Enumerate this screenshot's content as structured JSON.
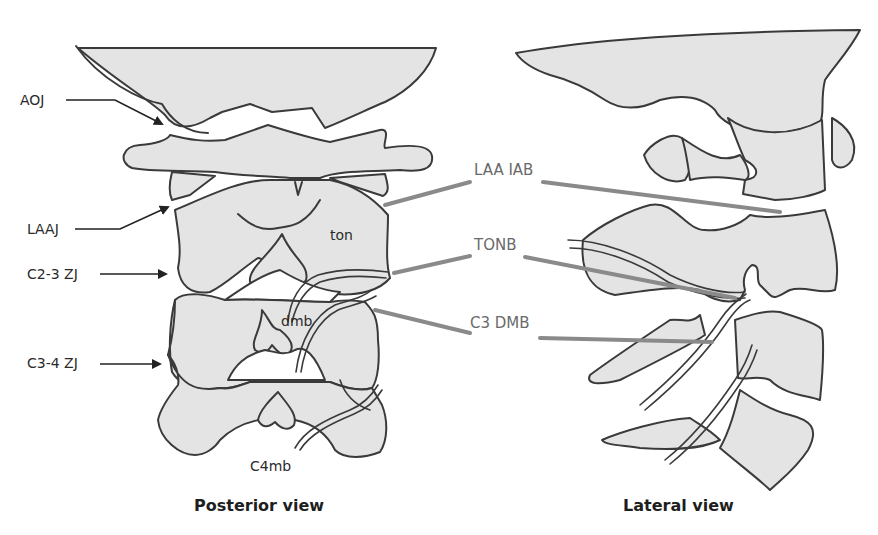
{
  "figure": {
    "type": "anatomical-diagram",
    "colors": {
      "bone_fill": "#e4e4e4",
      "outline": "#3a3a3a",
      "needle": "#8a8a8a",
      "background": "#ffffff"
    }
  },
  "posterior_view": {
    "caption": "Posterior view",
    "joint_labels": [
      {
        "id": "aoj",
        "text": "AOJ"
      },
      {
        "id": "laaj",
        "text": "LAAJ"
      },
      {
        "id": "c23zj",
        "text": "C2-3 ZJ"
      },
      {
        "id": "c34zj",
        "text": "C3-4 ZJ"
      }
    ],
    "nerve_labels": [
      {
        "id": "ton",
        "text": "ton"
      },
      {
        "id": "dmb",
        "text": "dmb"
      },
      {
        "id": "c4mb",
        "text": "C4mb"
      }
    ]
  },
  "lateral_view": {
    "caption": "Lateral view"
  },
  "shared_labels": [
    {
      "id": "laa_iab",
      "text": "LAA IAB"
    },
    {
      "id": "tonb",
      "text": "TONB"
    },
    {
      "id": "c3_dmb",
      "text": "C3 DMB"
    }
  ]
}
